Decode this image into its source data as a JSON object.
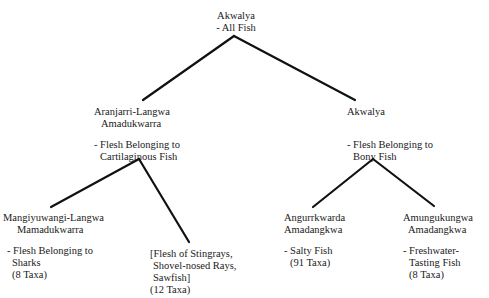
{
  "diagram": {
    "root": {
      "name": "Akwalya",
      "description": "- All Fish"
    },
    "level1": [
      {
        "id": "cartilaginous",
        "name_lines": [
          "Aranjarri-Langwa",
          "Amadukwarra"
        ],
        "description_lines": [
          "- Flesh Belonging to",
          "Cartilaginous Fish"
        ]
      },
      {
        "id": "bony",
        "name_lines": [
          "Akwalya"
        ],
        "description_lines": [
          "- Flesh Belonging to",
          "Bony Fish"
        ]
      }
    ],
    "level2": [
      {
        "id": "sharks",
        "parent": "cartilaginous",
        "name_lines": [
          "Mangiyuwangi-Langwa",
          "Mamadukwarra"
        ],
        "description_lines": [
          "- Flesh Belonging to",
          "Sharks",
          "(8 Taxa)"
        ]
      },
      {
        "id": "rays",
        "parent": "cartilaginous",
        "name_lines": [],
        "description_lines": [
          "[Flesh of Stingrays,",
          "Shovel-nosed Rays,",
          "Sawfish]",
          "(12 Taxa)"
        ]
      },
      {
        "id": "salty",
        "parent": "bony",
        "name_lines": [
          "Angurrkwarda",
          "Amadangkwa"
        ],
        "description_lines": [
          "- Salty Fish",
          "(91 Taxa)"
        ]
      },
      {
        "id": "freshwater",
        "parent": "bony",
        "name_lines": [
          "Amungukungwa",
          "Amadangkwa"
        ],
        "description_lines": [
          "- Freshwater-",
          "Tasting Fish",
          "(8 Taxa)"
        ]
      }
    ]
  }
}
